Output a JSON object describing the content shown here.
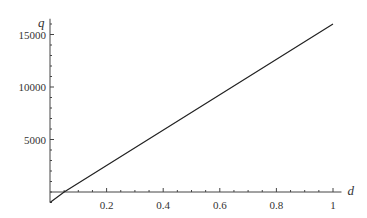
{
  "chart_data": {
    "type": "line",
    "title": "",
    "xlabel": "d",
    "ylabel": "q",
    "xlim": [
      0,
      1.03
    ],
    "ylim": [
      -1000,
      16500
    ],
    "x_ticks": [
      0.2,
      0.4,
      0.6,
      0.8,
      1
    ],
    "x_tick_labels": [
      "0.2",
      "0.4",
      "0.6",
      "0.8",
      "1"
    ],
    "y_ticks": [
      5000,
      10000,
      15000
    ],
    "y_tick_labels": [
      "5000",
      "10000",
      "15000"
    ],
    "grid": false,
    "legend": null,
    "series": [
      {
        "name": "q(d)",
        "x": [
          0,
          0.05,
          1
        ],
        "y": [
          -1000,
          0,
          16000
        ]
      }
    ]
  },
  "colors": {
    "line": "#222222",
    "axis": "#444444",
    "text": "#333333"
  }
}
